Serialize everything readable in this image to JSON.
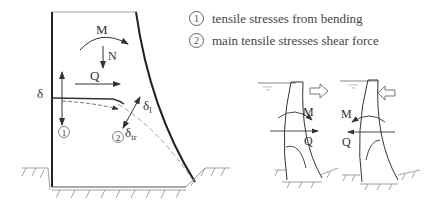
{
  "legend": {
    "items": [
      {
        "marker": "1",
        "text": "tensile stresses from bending"
      },
      {
        "marker": "2",
        "text": "main tensile stresses shear force"
      }
    ]
  },
  "left_diagram": {
    "labels": {
      "moment": "M",
      "normal": "N",
      "shear": "Q",
      "delta": "δ",
      "delta_l": "δ",
      "delta_l_sub": "l",
      "delta_tr": "δ",
      "delta_tr_sub": "tr",
      "marker1": "1",
      "marker2": "2"
    }
  },
  "right_diagrams": [
    {
      "moment": "M",
      "shear": "Q",
      "load_direction": "outward"
    },
    {
      "moment": "M",
      "shear": "Q",
      "load_direction": "inward"
    }
  ],
  "colors": {
    "line": "#333333",
    "ground": "#888888"
  }
}
